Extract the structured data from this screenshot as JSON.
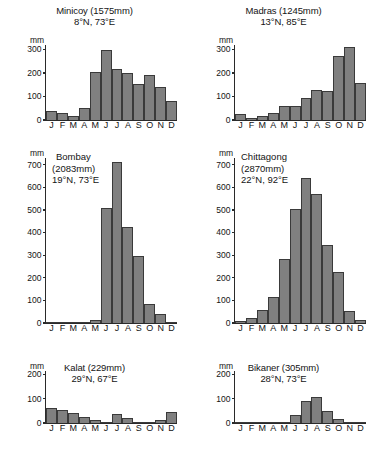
{
  "figure": {
    "kind": "climate-rainfall-panels",
    "panel_count": 6,
    "unit_label": "mm",
    "months": [
      "J",
      "F",
      "M",
      "A",
      "M",
      "J",
      "J",
      "A",
      "S",
      "O",
      "N",
      "D"
    ],
    "bar_color": "#808080",
    "bar_outline_color": "#3a3a3a",
    "axis_color": "#2a2a2a",
    "text_color": "#141414",
    "background": "#ffffff"
  },
  "panels": [
    {
      "id": "minicoy",
      "name": "Minicoy",
      "title_line1": "Minicoy (1575mm)",
      "title_line2": "8°N, 73°E",
      "annual_total_mm": 1575,
      "latitude": "8°N",
      "longitude": "73°E",
      "title_style": "above",
      "yticks": [
        "0",
        "100",
        "200",
        "300"
      ]
    },
    {
      "id": "madras",
      "name": "Madras",
      "title_line1": "Madras (1245mm)",
      "title_line2": "13°N, 85°E",
      "annual_total_mm": 1245,
      "latitude": "13°N",
      "longitude": "85°E",
      "title_style": "above",
      "yticks": [
        "0",
        "100",
        "200",
        "300"
      ]
    },
    {
      "id": "bombay",
      "name": "Bombay",
      "title_line1": "Bombay",
      "title_line2": "(2083mm)",
      "title_line3": "19°N, 73°E",
      "annual_total_mm": 2083,
      "latitude": "19°N",
      "longitude": "73°E",
      "title_style": "inset",
      "yticks": [
        "0",
        "100",
        "200",
        "300",
        "400",
        "500",
        "600",
        "700"
      ]
    },
    {
      "id": "chittagong",
      "name": "Chittagong",
      "title_line1": "Chittagong",
      "title_line2": "(2870mm)",
      "title_line3": "22°N, 92°E",
      "annual_total_mm": 2870,
      "latitude": "22°N",
      "longitude": "92°E",
      "title_style": "inset",
      "yticks": [
        "0",
        "100",
        "200",
        "300",
        "400",
        "500",
        "600",
        "700"
      ]
    },
    {
      "id": "kalat",
      "name": "Kalat",
      "title_line1": "Kalat (229mm)",
      "title_line2": "29°N, 67°E",
      "annual_total_mm": 229,
      "latitude": "29°N",
      "longitude": "67°E",
      "title_style": "above",
      "yticks": [
        "0",
        "100",
        "200"
      ]
    },
    {
      "id": "bikaner",
      "name": "Bikaner",
      "title_line1": "Bikaner (305mm)",
      "title_line2": "28°N, 73°E",
      "annual_total_mm": 305,
      "latitude": "28°N",
      "longitude": "73°E",
      "title_style": "above",
      "yticks": [
        "0",
        "100",
        "200"
      ]
    }
  ],
  "chart_data": [
    {
      "type": "bar",
      "title": "Minicoy (1575mm)",
      "subtitle": "8°N, 73°E",
      "xlabel": "",
      "ylabel": "mm",
      "ylim": [
        0,
        320
      ],
      "ytick_values": [
        0,
        100,
        200,
        300
      ],
      "grid": false,
      "legend": "none",
      "categories": [
        "J",
        "F",
        "M",
        "A",
        "M",
        "J",
        "J",
        "A",
        "S",
        "O",
        "N",
        "D"
      ],
      "values": [
        38,
        28,
        15,
        53,
        203,
        298,
        218,
        200,
        155,
        193,
        142,
        80
      ]
    },
    {
      "type": "bar",
      "title": "Madras (1245mm)",
      "subtitle": "13°N, 85°E",
      "xlabel": "",
      "ylabel": "mm",
      "ylim": [
        0,
        320
      ],
      "ytick_values": [
        0,
        100,
        200,
        300
      ],
      "grid": false,
      "legend": "none",
      "categories": [
        "J",
        "F",
        "M",
        "A",
        "M",
        "J",
        "J",
        "A",
        "S",
        "O",
        "N",
        "D"
      ],
      "values": [
        27,
        10,
        18,
        28,
        58,
        60,
        96,
        130,
        122,
        275,
        312,
        158
      ]
    },
    {
      "type": "bar",
      "title": "Bombay (2083mm)",
      "subtitle": "19°N, 73°E",
      "xlabel": "",
      "ylabel": "mm",
      "ylim": [
        0,
        730
      ],
      "ytick_values": [
        0,
        100,
        200,
        300,
        400,
        500,
        600,
        700
      ],
      "grid": false,
      "legend": "none",
      "categories": [
        "J",
        "F",
        "M",
        "A",
        "M",
        "J",
        "J",
        "A",
        "S",
        "O",
        "N",
        "D"
      ],
      "values": [
        3,
        1,
        1,
        1,
        12,
        508,
        714,
        424,
        297,
        86,
        38,
        2
      ]
    },
    {
      "type": "bar",
      "title": "Chittagong (2870mm)",
      "subtitle": "22°N, 92°E",
      "xlabel": "",
      "ylabel": "mm",
      "ylim": [
        0,
        730
      ],
      "ytick_values": [
        0,
        100,
        200,
        300,
        400,
        500,
        600,
        700
      ],
      "grid": false,
      "legend": "none",
      "categories": [
        "J",
        "F",
        "M",
        "A",
        "M",
        "J",
        "J",
        "A",
        "S",
        "O",
        "N",
        "D"
      ],
      "values": [
        10,
        22,
        57,
        113,
        285,
        506,
        643,
        570,
        344,
        225,
        55,
        14
      ]
    },
    {
      "type": "bar",
      "title": "Kalat (229mm)",
      "subtitle": "29°N, 67°E",
      "xlabel": "",
      "ylabel": "mm",
      "ylim": [
        0,
        215
      ],
      "ytick_values": [
        0,
        100,
        200
      ],
      "grid": false,
      "legend": "none",
      "categories": [
        "J",
        "F",
        "M",
        "A",
        "M",
        "J",
        "J",
        "A",
        "S",
        "O",
        "N",
        "D"
      ],
      "values": [
        62,
        52,
        41,
        24,
        12,
        6,
        38,
        22,
        5,
        2,
        14,
        45
      ]
    },
    {
      "type": "bar",
      "title": "Bikaner (305mm)",
      "subtitle": "28°N, 73°E",
      "xlabel": "",
      "ylabel": "mm",
      "ylim": [
        0,
        215
      ],
      "ytick_values": [
        0,
        100,
        200
      ],
      "grid": false,
      "legend": "none",
      "categories": [
        "J",
        "F",
        "M",
        "A",
        "M",
        "J",
        "J",
        "A",
        "S",
        "O",
        "N",
        "D"
      ],
      "values": [
        4,
        4,
        3,
        4,
        6,
        33,
        91,
        108,
        50,
        15,
        3,
        3
      ]
    }
  ]
}
